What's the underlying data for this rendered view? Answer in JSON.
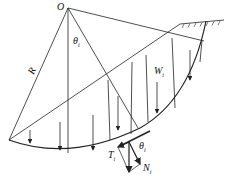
{
  "diagram": {
    "labels": {
      "center": "O",
      "radius": "R",
      "angle": "θ",
      "angle_sub": "i",
      "weight": "W",
      "weight_sub": "i",
      "shear": "T",
      "shear_sub": "i",
      "angle2": "θ",
      "angle2_sub": "i",
      "normal": "N",
      "normal_sub": "i"
    },
    "colors": {
      "line": "#222222",
      "background": "#ffffff"
    }
  }
}
